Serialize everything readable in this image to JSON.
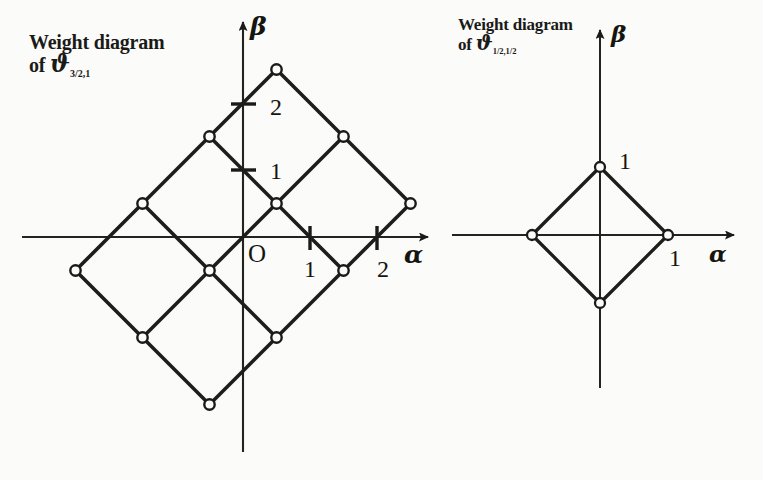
{
  "figure": {
    "background_color": "#fbfbf9",
    "ink_color": "#1a1a18",
    "panels": [
      {
        "id": "left",
        "caption_line1": "Weight diagram",
        "caption_line2_prefix": "of ",
        "caption_symbol": "ϑ",
        "caption_subscript": "3/2,1",
        "origin_label": "O",
        "axis_x_label": "α",
        "axis_y_label": "β",
        "x_ticks": [
          {
            "value": 1,
            "label": "1"
          },
          {
            "value": 2,
            "label": "2"
          }
        ],
        "y_ticks": [
          {
            "value": 1,
            "label": "1"
          },
          {
            "value": 2,
            "label": "2"
          }
        ],
        "lattice": {
          "description": "3 by 3 grid of rotated unit squares; nodes on half-integer diagonal lattice",
          "unit_px": 67,
          "origin_px": [
            243,
            237
          ],
          "nodes": [
            [
              0.5,
              2.5
            ],
            [
              -0.5,
              1.5
            ],
            [
              1.5,
              1.5
            ],
            [
              -1.5,
              0.5
            ],
            [
              0.5,
              0.5
            ],
            [
              2.5,
              0.5
            ],
            [
              -2.5,
              -0.5
            ],
            [
              -0.5,
              -0.5
            ],
            [
              1.5,
              -0.5
            ],
            [
              -1.5,
              -1.5
            ],
            [
              0.5,
              -1.5
            ],
            [
              -0.5,
              -2.5
            ]
          ],
          "edges": [
            [
              [
                0.5,
                2.5
              ],
              [
                -0.5,
                1.5
              ]
            ],
            [
              [
                0.5,
                2.5
              ],
              [
                1.5,
                1.5
              ]
            ],
            [
              [
                -0.5,
                1.5
              ],
              [
                -1.5,
                0.5
              ]
            ],
            [
              [
                -0.5,
                1.5
              ],
              [
                0.5,
                0.5
              ]
            ],
            [
              [
                1.5,
                1.5
              ],
              [
                0.5,
                0.5
              ]
            ],
            [
              [
                1.5,
                1.5
              ],
              [
                2.5,
                0.5
              ]
            ],
            [
              [
                -1.5,
                0.5
              ],
              [
                -2.5,
                -0.5
              ]
            ],
            [
              [
                -1.5,
                0.5
              ],
              [
                -0.5,
                -0.5
              ]
            ],
            [
              [
                0.5,
                0.5
              ],
              [
                -0.5,
                -0.5
              ]
            ],
            [
              [
                0.5,
                0.5
              ],
              [
                1.5,
                -0.5
              ]
            ],
            [
              [
                2.5,
                0.5
              ],
              [
                1.5,
                -0.5
              ]
            ],
            [
              [
                -2.5,
                -0.5
              ],
              [
                -1.5,
                -1.5
              ]
            ],
            [
              [
                -0.5,
                -0.5
              ],
              [
                -1.5,
                -1.5
              ]
            ],
            [
              [
                -0.5,
                -0.5
              ],
              [
                0.5,
                -1.5
              ]
            ],
            [
              [
                1.5,
                -0.5
              ],
              [
                0.5,
                -1.5
              ]
            ],
            [
              [
                -1.5,
                -1.5
              ],
              [
                -0.5,
                -2.5
              ]
            ],
            [
              [
                0.5,
                -1.5
              ],
              [
                -0.5,
                -2.5
              ]
            ]
          ]
        }
      },
      {
        "id": "right",
        "caption_line1": "Weight diagram",
        "caption_line2_prefix": "of ",
        "caption_symbol": "ϑ",
        "caption_subscript": "1/2,1/2",
        "origin_label": "",
        "axis_x_label": "α",
        "axis_y_label": "β",
        "x_ticks": [
          {
            "value": 1,
            "label": "1"
          }
        ],
        "y_ticks": [
          {
            "value": 1,
            "label": "1"
          }
        ],
        "lattice": {
          "description": "single rotated square (diamond) with four nodes on the axes at distance 1",
          "unit_px": 68,
          "origin_px": [
            600,
            235
          ],
          "nodes": [
            [
              0,
              1
            ],
            [
              1,
              0
            ],
            [
              0,
              -1
            ],
            [
              -1,
              0
            ]
          ],
          "edges": [
            [
              [
                0,
                1
              ],
              [
                1,
                0
              ]
            ],
            [
              [
                1,
                0
              ],
              [
                0,
                -1
              ]
            ],
            [
              [
                0,
                -1
              ],
              [
                -1,
                0
              ]
            ],
            [
              [
                -1,
                0
              ],
              [
                0,
                1
              ]
            ]
          ]
        }
      }
    ]
  }
}
